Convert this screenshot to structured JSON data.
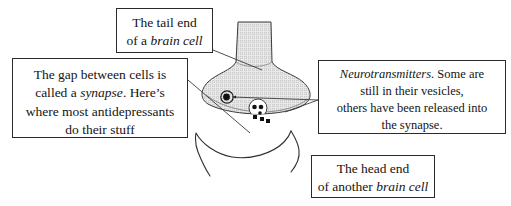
{
  "figure": {
    "background_color": "#ffffff",
    "ink_color": "#141414",
    "cell_fill_color": "#d8d8d8",
    "vesicle_color": "#111111"
  },
  "callouts": {
    "tail_end": {
      "name": "tail-end-of-brain-cell",
      "line1": "The tail end",
      "line2_plain": "of a ",
      "line2_italic": "brain cell"
    },
    "synapse_gap": {
      "name": "synapse-gap-antidepressants",
      "line1": "The gap between cells is",
      "line2_plain_a": "called a ",
      "line2_italic": "synapse",
      "line2_plain_b": ". Here’s",
      "line3": "where most antidepressants",
      "line4": "do their stuff"
    },
    "neurotransmitters": {
      "name": "neurotransmitters-vesicles",
      "line1_italic": "Neurotransmitters",
      "line1_plain": ". Some are",
      "line2": "still in their vesicles,",
      "line3": "others have been released into",
      "line4": "the synapse."
    },
    "head_end": {
      "name": "head-end-of-another-brain-cell",
      "line1": "The head end",
      "line2_plain": "of another ",
      "line2_italic": "brain cell"
    }
  },
  "illustration": {
    "presynaptic_terminal": {
      "label": "presynaptic-axon-terminal",
      "description": "stippled bulb-shaped axon terminal with vertical stalk"
    },
    "postsynaptic_cell": {
      "label": "postsynaptic-dendrite",
      "description": "curved outline of receiving cell head"
    },
    "vesicles": {
      "label": "synaptic-vesicles",
      "count_inside": 2
    },
    "released_neurotransmitters": {
      "label": "released-neurotransmitter-dots",
      "count": 4
    },
    "synaptic_cleft": {
      "label": "synaptic-cleft"
    }
  }
}
